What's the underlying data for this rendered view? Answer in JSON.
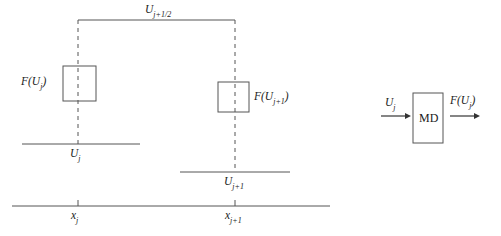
{
  "figure": {
    "background_color": "#ffffff",
    "line_color": "#555555",
    "text_color": "#222222",
    "title": "",
    "left_panel": {
      "name": "staggered-grid-update-schematic",
      "top_connector_label": "U",
      "top_connector_sub": "j+1/2",
      "flux_left_label": "F(U",
      "flux_left_sub": "j",
      "flux_left_close": ")",
      "flux_right_label": "F(U",
      "flux_right_sub": "j+1",
      "flux_right_close": ")",
      "cell_left_label": "U",
      "cell_left_sub": "j",
      "cell_right_label": "U",
      "cell_right_sub": "j+1",
      "axis_tick_left_label": "x",
      "axis_tick_left_sub": "j",
      "axis_tick_right_label": "x",
      "axis_tick_right_sub": "j+1"
    },
    "right_panel": {
      "name": "md-operator-block",
      "block_label": "MD",
      "input_label": "U",
      "input_sub": "j",
      "output_label": "F(U",
      "output_sub": "j",
      "output_close": ")"
    }
  }
}
